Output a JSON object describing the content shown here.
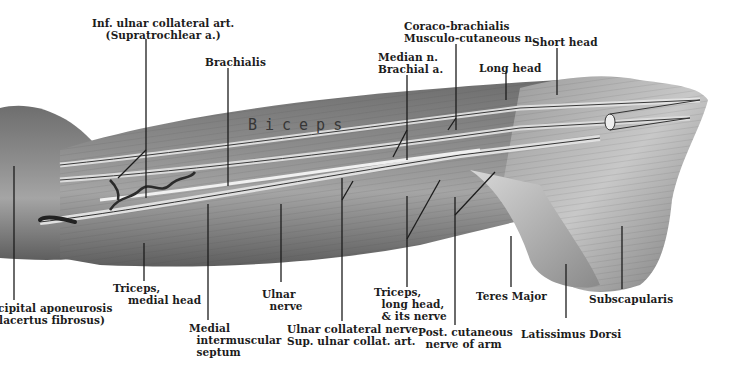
{
  "figure": {
    "muscle_text": "Biceps"
  },
  "labels": {
    "inf_ulnar": "Inf. ulnar collateral art.\n(Supratrochlear a.)",
    "brachialis": "Brachialis",
    "median": "Median n.\nBrachial a.",
    "coraco": "Coraco-brachialis\nMusculo-cutaneous n.",
    "long_head": "Long head",
    "short_head": "Short head",
    "bicipital": "icipital aponeurosis\n(lacertus fibrosus)",
    "triceps_medial": "Triceps,\n    medial head",
    "medial_septum": "Medial\n  intermuscular\n  septum",
    "ulnar_nerve": "Ulnar\n  nerve",
    "ulnar_collateral": "Ulnar collateral nerve\nSup. ulnar collat. art.",
    "triceps_long": "Triceps,\n  long head,\n  & its nerve",
    "post_cutaneous": "Post. cutaneous\n  nerve of arm",
    "teres_major": "Teres Major",
    "latissimus": "Latissimus Dorsi",
    "subscapularis": "Subscapularis"
  },
  "colors": {
    "ink": "#1c1c1c",
    "muscle_dark": "#4a4a4a",
    "muscle_mid": "#8a8a8a",
    "muscle_light": "#cfcfcf",
    "background": "#ffffff"
  }
}
